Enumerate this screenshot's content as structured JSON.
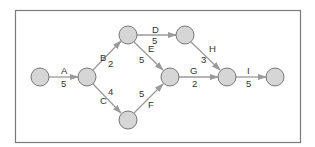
{
  "diagram": {
    "type": "activity-on-arrow network",
    "colors": {
      "node_fill": "#d6d6d6",
      "node_stroke": "#6a6a6a",
      "edge": "#9a9a9a",
      "frame": "#7a7a7a",
      "text": "#333333"
    },
    "nodes": [
      {
        "id": "n1",
        "x": 40,
        "y": 77
      },
      {
        "id": "n2",
        "x": 87,
        "y": 77
      },
      {
        "id": "n3",
        "x": 128,
        "y": 35
      },
      {
        "id": "n4",
        "x": 185,
        "y": 35
      },
      {
        "id": "n5",
        "x": 128,
        "y": 120
      },
      {
        "id": "n6",
        "x": 170,
        "y": 77
      },
      {
        "id": "n7",
        "x": 227,
        "y": 77
      },
      {
        "id": "n8",
        "x": 275,
        "y": 77
      }
    ],
    "activities": [
      {
        "name": "A",
        "duration": "5",
        "from": "n1",
        "to": "n2"
      },
      {
        "name": "B",
        "duration": "2",
        "from": "n2",
        "to": "n3"
      },
      {
        "name": "C",
        "duration": "4",
        "from": "n2",
        "to": "n5"
      },
      {
        "name": "D",
        "duration": "5",
        "from": "n3",
        "to": "n4"
      },
      {
        "name": "E",
        "duration": "5",
        "from": "n3",
        "to": "n6"
      },
      {
        "name": "F",
        "duration": "5",
        "from": "n5",
        "to": "n6"
      },
      {
        "name": "G",
        "duration": "2",
        "from": "n6",
        "to": "n7"
      },
      {
        "name": "H",
        "duration": "3",
        "from": "n4",
        "to": "n7"
      },
      {
        "name": "I",
        "duration": "5",
        "from": "n7",
        "to": "n8"
      }
    ]
  }
}
